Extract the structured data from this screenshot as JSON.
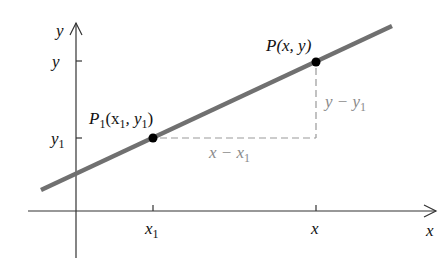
{
  "diagram": {
    "type": "coordinate-line-diagram",
    "axes": {
      "x_label": "x",
      "y_label": "y"
    },
    "ticks": {
      "x": [
        {
          "main": "x",
          "sub": "1",
          "id": "x1"
        },
        {
          "main": "x",
          "sub": "",
          "id": "x"
        }
      ],
      "y": [
        {
          "main": "y",
          "sub": "",
          "id": "y"
        },
        {
          "main": "y",
          "sub": "1",
          "id": "y1"
        }
      ]
    },
    "points": [
      {
        "name": "P",
        "sub": "1",
        "coords_text": "(x",
        "coords_sub1": "1",
        "coords_mid": ", y",
        "coords_sub2": "1",
        "coords_end": ")"
      },
      {
        "name": "P",
        "coords_text": "(x, y)"
      }
    ],
    "differences": {
      "horizontal": {
        "main": "x − x",
        "sub": "1"
      },
      "vertical": {
        "main": "y − y",
        "sub": "1"
      }
    },
    "colors": {
      "line": "#707070",
      "axes": "#333333",
      "dashed": "#999999",
      "diff_text": "#8a8a8a",
      "point": "#000000",
      "text": "#111111"
    }
  }
}
